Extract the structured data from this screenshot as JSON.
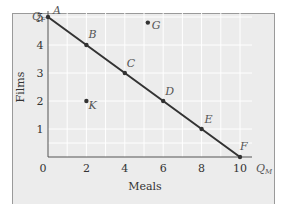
{
  "chart_data": {
    "type": "line",
    "title": "",
    "xlabel": "Meals",
    "ylabel": "Films",
    "x_axis_symbol": "Q_M",
    "y_axis_symbol": "Q_F",
    "xlim": [
      0,
      10
    ],
    "ylim": [
      0,
      5
    ],
    "xticks": [
      0,
      2,
      4,
      6,
      8,
      10
    ],
    "yticks": [
      1,
      2,
      3,
      4,
      5
    ],
    "grid": true,
    "series": [
      {
        "name": "Budget line",
        "points": [
          {
            "label": "A",
            "x": 0,
            "y": 5
          },
          {
            "label": "B",
            "x": 2,
            "y": 4
          },
          {
            "label": "C",
            "x": 4,
            "y": 3
          },
          {
            "label": "D",
            "x": 6,
            "y": 2
          },
          {
            "label": "E",
            "x": 8,
            "y": 1
          },
          {
            "label": "F",
            "x": 10,
            "y": 0
          }
        ]
      },
      {
        "name": "Other bundles",
        "points": [
          {
            "label": "G",
            "x": 5.2,
            "y": 4.8
          },
          {
            "label": "K",
            "x": 2,
            "y": 2
          }
        ]
      }
    ],
    "colors": {
      "line": "#333333",
      "background": "#ececec",
      "grid": "#ffffff"
    }
  }
}
